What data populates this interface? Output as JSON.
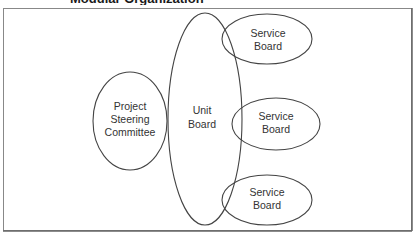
{
  "figure": {
    "title_visible_fragment": "Modular Organization",
    "frame_color": "#777777",
    "stroke_color": "#444444"
  },
  "nodes": {
    "project_steering_committee": {
      "line1": "Project",
      "line2": "Steering",
      "line3": "Committee"
    },
    "unit_board": {
      "line1": "Unit",
      "line2": "Board"
    },
    "service_board_top": {
      "line1": "Service",
      "line2": "Board"
    },
    "service_board_middle": {
      "line1": "Service",
      "line2": "Board"
    },
    "service_board_bottom": {
      "line1": "Service",
      "line2": "Board"
    }
  }
}
